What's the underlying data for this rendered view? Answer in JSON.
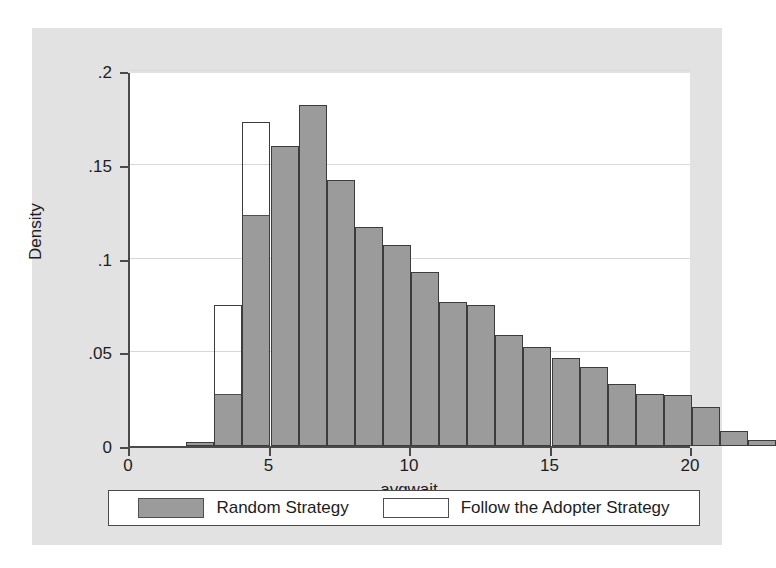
{
  "chart_data": {
    "type": "bar",
    "chart_style": "histogram-overlaid",
    "title": "",
    "xlabel": "avgwait",
    "ylabel": "Density",
    "xlim": [
      0,
      20
    ],
    "ylim": [
      0,
      0.2
    ],
    "grid": true,
    "bin_width": 1,
    "x_ticks": [
      "0",
      "5",
      "10",
      "15",
      "20"
    ],
    "x_tick_values": [
      0,
      5,
      10,
      15,
      20
    ],
    "y_ticks": [
      "0",
      ".05",
      ".1",
      ".15",
      ".2"
    ],
    "y_tick_values": [
      0,
      0.05,
      0.1,
      0.15,
      0.2
    ],
    "bin_left_edges": [
      2,
      3,
      4,
      5,
      6,
      7,
      8,
      9,
      10,
      11,
      12,
      13,
      14,
      15,
      16,
      17,
      18,
      19
    ],
    "legend_position": "below-axis",
    "series": [
      {
        "name": "Random Strategy",
        "style": "filled",
        "color": "#9b9b9b",
        "values": [
          0.002,
          0.028,
          0.123,
          0.16,
          0.182,
          0.142,
          0.117,
          0.107,
          0.093,
          0.077,
          0.075,
          0.059,
          0.053,
          0.047,
          0.042,
          0.033,
          0.028,
          0.027
        ]
      },
      {
        "name": "Follow the Adopter Strategy",
        "style": "hollow",
        "color": "#ffffff",
        "values": [
          0.002,
          0.075,
          0.173,
          0.16,
          0.182,
          0.142,
          0.117,
          0.107,
          0.093,
          0.077,
          0.075,
          0.059,
          0.053,
          0.047,
          0.042,
          0.033,
          0.028,
          0.027
        ]
      }
    ],
    "tail_bins": {
      "note": "bins after 19 taper to zero",
      "extra_left_edges": [
        20,
        21,
        22
      ],
      "extra_values": [
        0.021,
        0.008,
        0.003
      ]
    }
  },
  "axis": {
    "y_label": "Density",
    "x_label": "avgwait",
    "y_ticks": [
      {
        "label": ".2",
        "value": 0.2
      },
      {
        "label": ".15",
        "value": 0.15
      },
      {
        "label": ".1",
        "value": 0.1
      },
      {
        "label": ".05",
        "value": 0.05
      },
      {
        "label": "0",
        "value": 0.0
      }
    ],
    "x_ticks": [
      {
        "label": "0",
        "value": 0
      },
      {
        "label": "5",
        "value": 5
      },
      {
        "label": "10",
        "value": 10
      },
      {
        "label": "15",
        "value": 15
      },
      {
        "label": "20",
        "value": 20
      }
    ]
  },
  "legend": {
    "entries": [
      {
        "label": "Random Strategy",
        "style": "filled"
      },
      {
        "label": "Follow the Adopter Strategy",
        "style": "hollow"
      }
    ]
  },
  "colors": {
    "page_background": "#ffffff",
    "card_background": "#e2e2e2",
    "plot_background": "#ffffff",
    "bar_fill": "#9b9b9b",
    "bar_outline": "#4f4f4f",
    "axis": "#4a4a4a",
    "gridline": "#d8d8d8",
    "text": "#1d1d1d"
  }
}
